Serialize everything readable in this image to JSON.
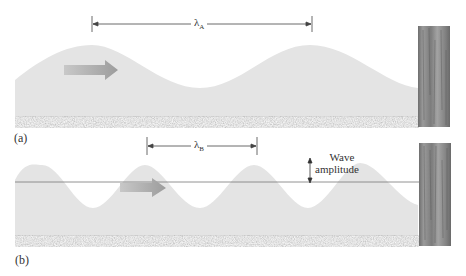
{
  "panels": [
    {
      "id": "a",
      "label": "(a)",
      "wavelength_symbol": "λ",
      "wavelength_subscript": "A",
      "description": "long wavelength wave approaching post"
    },
    {
      "id": "b",
      "label": "(b)",
      "wavelength_symbol": "λ",
      "wavelength_subscript": "B",
      "description": "short wavelength wave approaching post",
      "amplitude_label_line1": "Wave",
      "amplitude_label_line2": "amplitude"
    }
  ],
  "colors": {
    "water": "#e4e4e4",
    "sand": "#8a8a8a",
    "post": "#8b8b8b",
    "arrow": "#a9a9a9",
    "line": "#555555"
  }
}
